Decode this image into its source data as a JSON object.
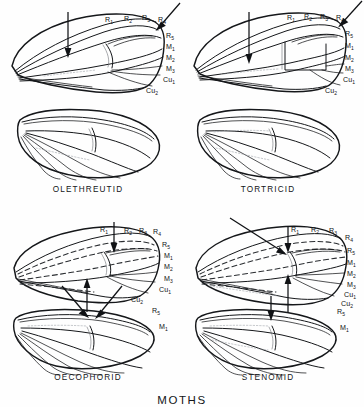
{
  "plate": {
    "title": "MOTHS",
    "background_color": "#fefefe",
    "ink_color": "#15171a"
  },
  "panels": [
    {
      "id": "olethreutid",
      "caption": "OLETHREUTID",
      "caption_x": 88,
      "caption_y": 192,
      "forewing_labels": [
        {
          "base": "R",
          "sub": "1",
          "x": 105,
          "y": 22
        },
        {
          "base": "R",
          "sub": "2",
          "x": 124,
          "y": 21
        },
        {
          "base": "R",
          "sub": "3",
          "x": 142,
          "y": 20
        },
        {
          "base": "R",
          "sub": "4",
          "x": 158,
          "y": 22
        },
        {
          "base": "R",
          "sub": "5",
          "x": 166,
          "y": 38
        },
        {
          "base": "M",
          "sub": "1",
          "x": 166,
          "y": 49
        },
        {
          "base": "M",
          "sub": "2",
          "x": 166,
          "y": 60
        },
        {
          "base": "M",
          "sub": "3",
          "x": 166,
          "y": 71
        },
        {
          "base": "Cu",
          "sub": "1",
          "x": 163,
          "y": 82
        },
        {
          "base": "Cu",
          "sub": "2",
          "x": 146,
          "y": 93
        }
      ],
      "hindwing_labels": [],
      "arrows": [
        {
          "name": "cell-arrow-down",
          "type": "vertical-down",
          "x": 68,
          "y1": 12,
          "y2": 56
        },
        {
          "name": "apex-arrow-diagonal",
          "type": "diagonal",
          "x1": 180,
          "y1": 3,
          "x2": 156,
          "y2": 30
        }
      ]
    },
    {
      "id": "tortricid",
      "caption": "TORTRICID",
      "caption_x": 268,
      "caption_y": 192,
      "forewing_labels": [
        {
          "base": "R",
          "sub": "1",
          "x": 287,
          "y": 20
        },
        {
          "base": "R",
          "sub": "2",
          "x": 304,
          "y": 19
        },
        {
          "base": "R",
          "sub": "3",
          "x": 320,
          "y": 19
        },
        {
          "base": "R",
          "sub": "4",
          "x": 336,
          "y": 20
        },
        {
          "base": "R",
          "sub": "5",
          "x": 345,
          "y": 36
        },
        {
          "base": "M",
          "sub": "1",
          "x": 345,
          "y": 48
        },
        {
          "base": "M",
          "sub": "2",
          "x": 345,
          "y": 60
        },
        {
          "base": "M",
          "sub": "3",
          "x": 345,
          "y": 71
        },
        {
          "base": "Cu",
          "sub": "1",
          "x": 343,
          "y": 82
        },
        {
          "base": "Cu",
          "sub": "2",
          "x": 325,
          "y": 93
        }
      ],
      "hindwing_labels": [],
      "arrows": [
        {
          "name": "cell-arrow-down",
          "type": "vertical-down",
          "x": 249,
          "y1": 12,
          "y2": 62
        },
        {
          "name": "apex-arrow-diagonal",
          "type": "diagonal",
          "x1": 360,
          "y1": 2,
          "x2": 338,
          "y2": 26
        }
      ]
    },
    {
      "id": "oecophorid",
      "caption": "OECOPHORID",
      "caption_x": 88,
      "caption_y": 380,
      "forewing_labels": [
        {
          "base": "R",
          "sub": "1",
          "x": 100,
          "y": 232
        },
        {
          "base": "R",
          "sub": "2",
          "x": 124,
          "y": 233
        },
        {
          "base": "R",
          "sub": "3",
          "x": 139,
          "y": 233
        },
        {
          "base": "R",
          "sub": "4",
          "x": 153,
          "y": 234
        },
        {
          "base": "R",
          "sub": "5",
          "x": 162,
          "y": 247
        },
        {
          "base": "M",
          "sub": "1",
          "x": 164,
          "y": 258
        },
        {
          "base": "M",
          "sub": "2",
          "x": 164,
          "y": 269
        },
        {
          "base": "M",
          "sub": "3",
          "x": 164,
          "y": 281
        },
        {
          "base": "Cu",
          "sub": "1",
          "x": 159,
          "y": 292
        },
        {
          "base": "Cu",
          "sub": "2",
          "x": 131,
          "y": 302
        }
      ],
      "hindwing_labels": [
        {
          "base": "R",
          "sub": "5",
          "x": 152,
          "y": 313
        },
        {
          "base": "M",
          "sub": "1",
          "x": 159,
          "y": 329
        }
      ],
      "arrows": [
        {
          "name": "cell-arrow-up",
          "type": "vertical-up",
          "x": 87,
          "y1": 312,
          "y2": 280
        },
        {
          "name": "r1-arrow-down",
          "type": "vertical-down",
          "x": 114,
          "y1": 222,
          "y2": 252
        },
        {
          "name": "left-diagonal-arrow",
          "type": "diagonal",
          "x1": 64,
          "y1": 288,
          "x2": 88,
          "y2": 317
        },
        {
          "name": "right-diagonal-arrow",
          "type": "diagonal",
          "x1": 120,
          "y1": 288,
          "x2": 95,
          "y2": 318
        }
      ]
    },
    {
      "id": "stenomid",
      "caption": "STENOMID",
      "caption_x": 268,
      "caption_y": 380,
      "forewing_labels": [
        {
          "base": "R",
          "sub": "1",
          "x": 291,
          "y": 232
        },
        {
          "base": "R",
          "sub": "2",
          "x": 311,
          "y": 232
        },
        {
          "base": "R",
          "sub": "3",
          "x": 329,
          "y": 233
        },
        {
          "base": "R",
          "sub": "4",
          "x": 345,
          "y": 240
        },
        {
          "base": "R",
          "sub": "5",
          "x": 347,
          "y": 253
        },
        {
          "base": "M",
          "sub": "1",
          "x": 347,
          "y": 265
        },
        {
          "base": "M",
          "sub": "2",
          "x": 347,
          "y": 276
        },
        {
          "base": "M",
          "sub": "3",
          "x": 347,
          "y": 287
        },
        {
          "base": "Cu",
          "sub": "1",
          "x": 344,
          "y": 297
        },
        {
          "base": "Cu",
          "sub": "2",
          "x": 341,
          "y": 306
        }
      ],
      "hindwing_labels": [
        {
          "base": "R",
          "sub": "5",
          "x": 337,
          "y": 314
        },
        {
          "base": "M",
          "sub": "1",
          "x": 340,
          "y": 330
        }
      ],
      "arrows": [
        {
          "name": "cell-arrow-up",
          "type": "vertical-up",
          "x": 288,
          "y1": 312,
          "y2": 276
        },
        {
          "name": "cell-arrow-down",
          "type": "vertical-down",
          "x": 288,
          "y1": 226,
          "y2": 252
        },
        {
          "name": "apex-diagonal-arrow",
          "type": "diagonal",
          "x1": 230,
          "y1": 218,
          "x2": 285,
          "y2": 254
        },
        {
          "name": "hindwing-arrow-down",
          "type": "vertical-down",
          "x": 271,
          "y1": 296,
          "y2": 320
        }
      ]
    }
  ]
}
